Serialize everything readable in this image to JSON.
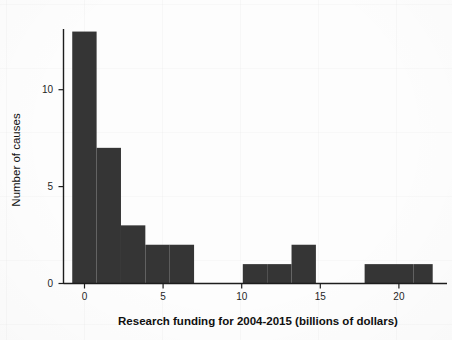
{
  "chart_data": {
    "type": "bar",
    "title": "",
    "xlabel": "Research funding for 2004-2015 (billions of dollars)",
    "ylabel": "Number of causes",
    "xlim": [
      -1.0,
      22.5
    ],
    "ylim": [
      0,
      13.6
    ],
    "xticks": [
      0,
      5,
      10,
      15,
      20
    ],
    "xtick_labels": [
      "0",
      "5",
      "10",
      "15",
      "20"
    ],
    "yticks": [
      0,
      5,
      10
    ],
    "ytick_labels": [
      "0",
      "5",
      "10"
    ],
    "grid": false,
    "legend": null,
    "bin_width": 1.55,
    "bar_color": "#353535",
    "bins": [
      {
        "x0": -0.78,
        "x1": 0.77,
        "value": 13
      },
      {
        "x0": 0.77,
        "x1": 2.32,
        "value": 7
      },
      {
        "x0": 2.32,
        "x1": 3.87,
        "value": 3
      },
      {
        "x0": 3.87,
        "x1": 5.42,
        "value": 2
      },
      {
        "x0": 5.42,
        "x1": 6.97,
        "value": 2
      },
      {
        "x0": 10.07,
        "x1": 11.62,
        "value": 1
      },
      {
        "x0": 11.62,
        "x1": 13.17,
        "value": 1
      },
      {
        "x0": 13.17,
        "x1": 14.72,
        "value": 2
      },
      {
        "x0": 17.82,
        "x1": 19.37,
        "value": 1
      },
      {
        "x0": 19.37,
        "x1": 20.92,
        "value": 1
      },
      {
        "x0": 20.92,
        "x1": 22.15,
        "value": 1
      }
    ],
    "categories": [
      "-0.8–0.8",
      "0.8–2.3",
      "2.3–3.9",
      "3.9–5.4",
      "5.4–7.0",
      "10.1–11.6",
      "11.6–13.2",
      "13.2–14.7",
      "17.8–19.4",
      "19.4–20.9",
      "20.9–22.2"
    ],
    "values": [
      13,
      7,
      3,
      2,
      2,
      1,
      1,
      2,
      1,
      1,
      1
    ]
  },
  "axes": {
    "x_title": "Research funding for 2004-2015 (billions of dollars)",
    "y_title": "Number of causes"
  },
  "ticks": {
    "x": [
      "0",
      "5",
      "10",
      "15",
      "20"
    ],
    "y": [
      "0",
      "5",
      "10"
    ]
  },
  "colors": {
    "bar": "#353535",
    "axis": "#1d1d1d",
    "background": "#fdfdfd",
    "text": "#101010"
  }
}
